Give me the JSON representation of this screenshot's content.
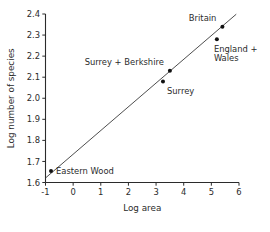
{
  "chart_data": {
    "type": "scatter",
    "title": "",
    "xlabel": "Log area",
    "ylabel": "Log number of species",
    "xlim": [
      -1,
      6
    ],
    "ylim": [
      1.6,
      2.4
    ],
    "xticks": [
      "-1",
      "0",
      "1",
      "2",
      "3",
      "4",
      "5",
      "6"
    ],
    "xtick_values": [
      -1,
      0,
      1,
      2,
      3,
      4,
      5,
      6
    ],
    "yticks": [
      "1.6",
      "1.7",
      "1.8",
      "1.9",
      "2.0",
      "2.1",
      "2.2",
      "2.3",
      "2.4"
    ],
    "ytick_values": [
      1.6,
      1.7,
      1.8,
      1.9,
      2.0,
      2.1,
      2.2,
      2.3,
      2.4
    ],
    "grid": false,
    "legend": "none",
    "points": [
      {
        "label": "Eastern Wood",
        "x": -0.8,
        "y": 1.655,
        "label_dx": 5,
        "label_dy": 3.2,
        "anchor": "start"
      },
      {
        "label": "Surrey",
        "x": 3.25,
        "y": 2.08,
        "label_dx": 4,
        "label_dy": 13,
        "anchor": "start"
      },
      {
        "label": "Surrey + Berkshire",
        "x": 3.5,
        "y": 2.13,
        "label_dx": -6,
        "label_dy": -6,
        "anchor": "end"
      },
      {
        "label": "England +",
        "x": 5.2,
        "y": 2.28,
        "label_dx": -3,
        "label_dy": 13,
        "anchor": "start"
      },
      {
        "label": "Britain",
        "x": 5.4,
        "y": 2.34,
        "label_dx": -6,
        "label_dy": -6,
        "anchor": "end"
      }
    ],
    "extra_labels": [
      {
        "text": "Wales",
        "x": 5.2,
        "y": 2.28,
        "dx": -3,
        "dy": 22,
        "anchor": "start"
      }
    ],
    "fit_line": {
      "description": "least-squares regression line",
      "x1": -1.0,
      "y1": 1.6215,
      "x2": 5.9,
      "y2": 2.399
    },
    "colors": {
      "axis": "#2b2b2b",
      "point": "#111111",
      "line": "#3a3a3a",
      "background": "#ffffff"
    }
  }
}
